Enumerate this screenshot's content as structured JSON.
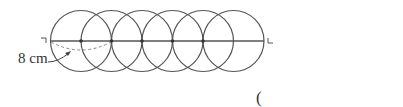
{
  "figure": {
    "circle_count": 6,
    "dimension_label": "8 cm",
    "answer_bracket": "(",
    "colors": {
      "stroke": "#555555",
      "dashed": "#888888",
      "text": "#333333"
    }
  }
}
